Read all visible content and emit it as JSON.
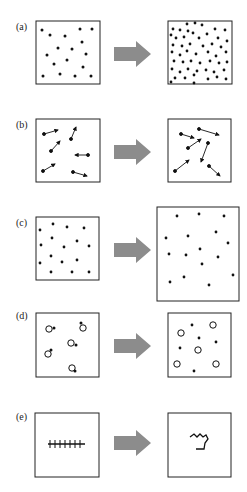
{
  "figure": {
    "panels": [
      {
        "label": "(a)",
        "description": "Increase in number of particles (density increases)"
      },
      {
        "label": "(b)",
        "description": "Increase in particle velocity (longer arrows)"
      },
      {
        "label": "(c)",
        "description": "Increase in volume (same particles, larger box)"
      },
      {
        "label": "(d)",
        "description": "Dissociation of bound pairs into separate particles"
      },
      {
        "label": "(e)",
        "description": "Extended chain collapses into random coil"
      }
    ],
    "arrow_color": "#8c8c8c",
    "box_border_color": "#222222",
    "dot_color": "#111111"
  }
}
